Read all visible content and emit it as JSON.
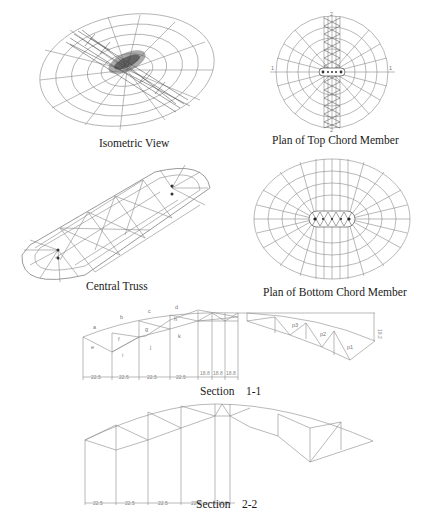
{
  "figures": {
    "isometric_view": {
      "caption": "Isometric View"
    },
    "plan_top_chord": {
      "caption": "Plan of Top Chord Member",
      "section_marks": {
        "left": "1",
        "right": "1",
        "top": "2",
        "bottom": "2"
      }
    },
    "central_truss": {
      "caption": "Central Truss"
    },
    "plan_bottom_chord": {
      "caption": "Plan of Bottom Chord Member"
    },
    "section_1_1": {
      "caption": "Section    1-1",
      "member_labels": [
        "a",
        "b",
        "c",
        "d",
        "e",
        "f",
        "g",
        "h",
        "i",
        "j",
        "k",
        "p1",
        "p2",
        "p3"
      ],
      "dimensions": [
        "22.5",
        "22.5",
        "22.5",
        "22.5",
        "18.8",
        "18.8",
        "18.8"
      ],
      "height_dimension": "19.2"
    },
    "section_2_2": {
      "caption": "Section    2-2",
      "dimensions": [
        "22.5",
        "22.5",
        "22.5",
        "22.5",
        "18.8"
      ]
    }
  }
}
